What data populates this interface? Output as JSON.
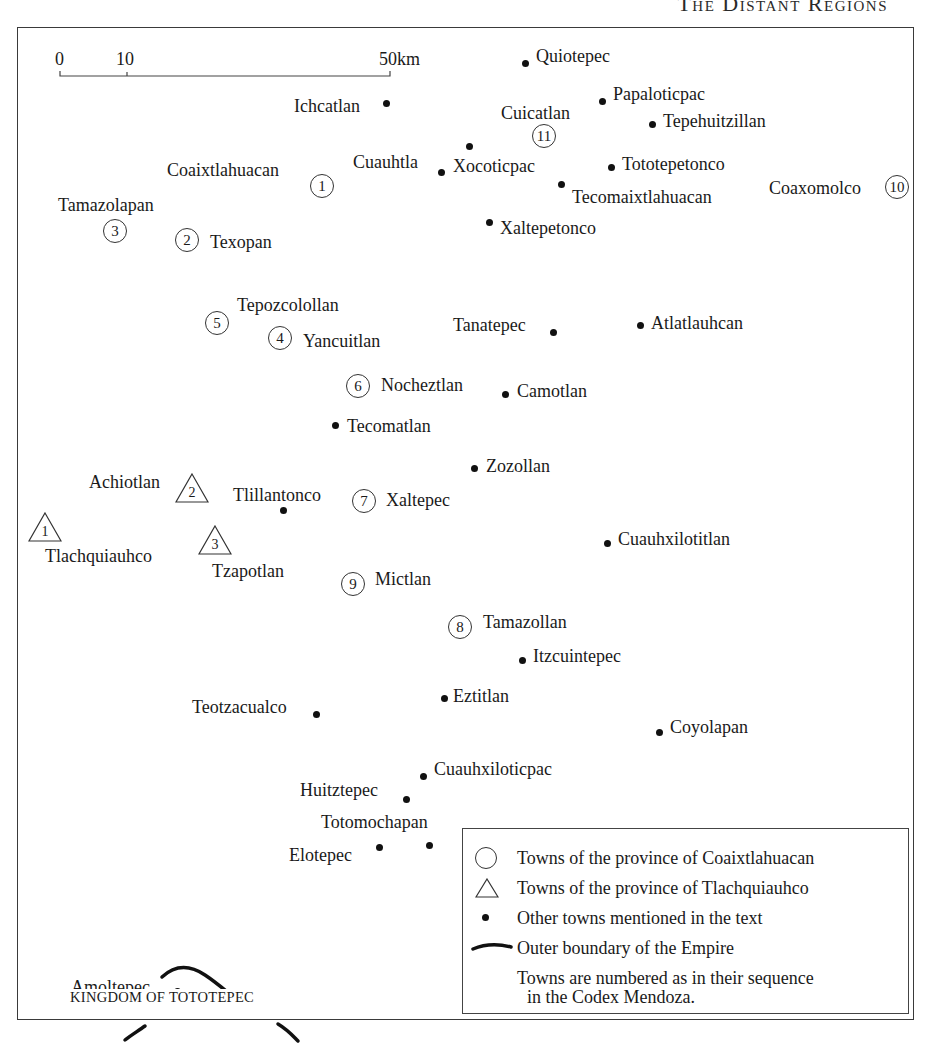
{
  "header": {
    "running_title": "The Distant Regions"
  },
  "scale_bar": {
    "ticks": [
      "0",
      "10",
      "50km"
    ]
  },
  "towns_other": [
    {
      "name": "Quiotepec"
    },
    {
      "name": "Ichcatlan"
    },
    {
      "name": "Papaloticpac"
    },
    {
      "name": "Tepehuitzillan"
    },
    {
      "name": "Cuauhtla"
    },
    {
      "name": "Xocoticpac"
    },
    {
      "name": "Tototepetonco"
    },
    {
      "name": "Tecomaixtlahuacan"
    },
    {
      "name": "Xaltepetonco"
    },
    {
      "name": "Tanatepec"
    },
    {
      "name": "Atlatlauhcan"
    },
    {
      "name": "Camotlan"
    },
    {
      "name": "Tecomatlan"
    },
    {
      "name": "Zozollan"
    },
    {
      "name": "Tlillantonco"
    },
    {
      "name": "Cuauhxilotitlan"
    },
    {
      "name": "Itzcuintepec"
    },
    {
      "name": "Eztitlan"
    },
    {
      "name": "Teotzacualco"
    },
    {
      "name": "Coyolapan"
    },
    {
      "name": "Cuauhxiloticpac"
    },
    {
      "name": "Huitztepec"
    },
    {
      "name": "Totomochapan"
    },
    {
      "name": "Elotepec"
    },
    {
      "name": "Amoltepec"
    }
  ],
  "towns_coaixtlahuacan": [
    {
      "num": "1",
      "name": "Coaixtlahuacan"
    },
    {
      "num": "2",
      "name": "Texopan"
    },
    {
      "num": "3",
      "name": "Tamazolapan"
    },
    {
      "num": "4",
      "name": "Yancuitlan"
    },
    {
      "num": "5",
      "name": "Tepozcolollan"
    },
    {
      "num": "6",
      "name": "Nocheztlan"
    },
    {
      "num": "7",
      "name": "Xaltepec"
    },
    {
      "num": "8",
      "name": "Tamazollan"
    },
    {
      "num": "9",
      "name": "Mictlan"
    },
    {
      "num": "10",
      "name": "Coaxomolco"
    },
    {
      "num": "11",
      "name": "Cuicatlan"
    }
  ],
  "towns_tlachquiauhco": [
    {
      "num": "1",
      "name": "Tlachquiauhco"
    },
    {
      "num": "2",
      "name": "Achiotlan"
    },
    {
      "num": "3",
      "name": "Tzapotlan"
    }
  ],
  "region_label": "KINGDOM OF TOTOTEPEC",
  "legend": {
    "items": [
      {
        "symbol": "circle-icon",
        "text": "Towns of the province of Coaixtlahuacan"
      },
      {
        "symbol": "triangle-icon",
        "text": "Towns of the province of Tlachquiauhco"
      },
      {
        "symbol": "dot-icon",
        "text": "Other towns mentioned in the text"
      },
      {
        "symbol": "boundary-line-icon",
        "text": "Outer boundary of the Empire"
      }
    ],
    "note_line1": "Towns are numbered as in their sequence",
    "note_line2": "in the Codex Mendoza."
  },
  "colors": {
    "ink": "#1a1a1a",
    "frame": "#3a3a3a",
    "background": "#ffffff"
  }
}
